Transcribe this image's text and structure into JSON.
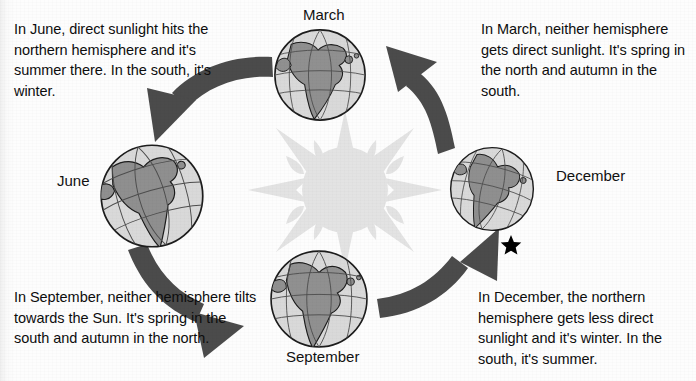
{
  "diagram": {
    "center_object": "sun",
    "rotation": "counterclockwise",
    "colors": {
      "background": "#fdfdfd",
      "text": "#0d0d0d",
      "arrow": "#4a4a4a",
      "sun": "#e2e2e2",
      "globe_ocean": "#d7d7d7",
      "globe_land": "#8f8f8f",
      "globe_outline": "#1a1a1a",
      "star": "#000000"
    }
  },
  "captions": {
    "june": "In June, direct sunlight hits the northern hemisphere and it's summer there. In the south, it's winter.",
    "march": "In March, neither hemisphere gets direct sunlight. It's spring in the north and autumn in the south.",
    "september": "In September, neither hemisphere tilts towards the Sun. It's spring in the south and autumn in the north.",
    "december": "In December, the northern hemisphere gets less direct sunlight and it's winter. In the south, it's summer."
  },
  "labels": {
    "march": "March",
    "june": "June",
    "december": "December",
    "september": "September"
  },
  "positions": {
    "march": "top",
    "june": "left",
    "december": "right",
    "september": "bottom"
  },
  "markers": {
    "star": "★"
  },
  "icons": {
    "sun": "sun-icon",
    "globe": "globe-icon",
    "star": "star-icon",
    "arrow": "curved-arrow-icon"
  }
}
